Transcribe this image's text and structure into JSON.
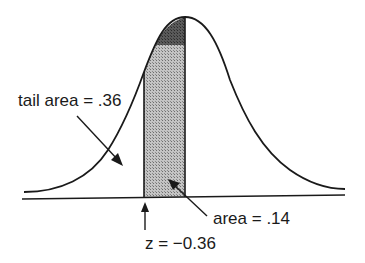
{
  "diagram": {
    "type": "normal-distribution-curve",
    "labels": {
      "tail_area": "tail area = .36",
      "area": "area = .14",
      "z_value": "z = −0.36"
    },
    "colors": {
      "curve": "#1a1a1a",
      "shade_light": "#a8a8a8",
      "shade_dark": "#555555",
      "background": "#ffffff"
    }
  }
}
